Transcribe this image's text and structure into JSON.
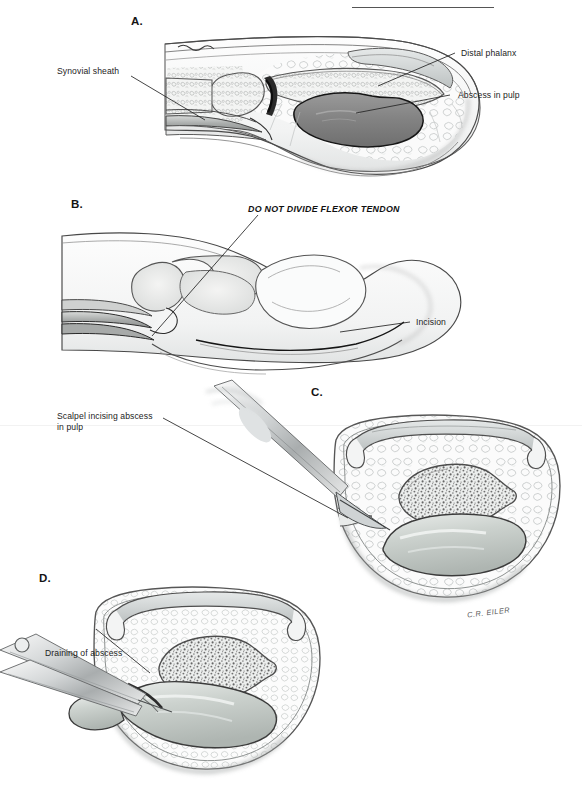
{
  "figure": {
    "title_rule": true,
    "artist_signature": "C.R. EILER",
    "panels": [
      {
        "id": "A",
        "letter": "A.",
        "description": "Sagittal section of distal finger showing felon: abscess in pulp space, distal phalanx, and synovial sheath",
        "labels": [
          {
            "name": "synovial-sheath",
            "text": "Synovial sheath",
            "side": "left"
          },
          {
            "name": "distal-phalanx",
            "text": "Distal phalanx",
            "side": "right"
          },
          {
            "name": "abscess-in-pulp",
            "text": "Abscess in pulp",
            "side": "right"
          }
        ]
      },
      {
        "id": "B",
        "letter": "B.",
        "description": "Lateral view of finger showing planned incision site over the pulp with warning about flexor tendon",
        "warning": "DO NOT DIVIDE FLEXOR TENDON",
        "labels": [
          {
            "name": "incision",
            "text": "Incision",
            "side": "right"
          }
        ]
      },
      {
        "id": "C",
        "letter": "C.",
        "description": "Cross section of fingertip with scalpel incising the abscess in the pulp space below the distal phalanx",
        "labels": [
          {
            "name": "scalpel-incising-abscess",
            "text": "Scalpel incising abscess\nin pulp",
            "side": "left"
          }
        ]
      },
      {
        "id": "D",
        "letter": "D.",
        "description": "Cross section of fingertip with hemostat draining the abscess, pus exuding from the incision",
        "labels": [
          {
            "name": "draining-of-abscess",
            "text": "Draining of abscess",
            "side": "left"
          }
        ]
      }
    ]
  },
  "colors": {
    "ink": "#1c1c1c",
    "leader_line": "#2a2a2a",
    "tissue_outline": "#6d6d6d",
    "abscess_dark": "#8a8a8a",
    "abscess_light": "#c9cdc9",
    "bone_stipple": "#7b7b7b",
    "fat_lobule": "#cfd3d2",
    "nail": "#b9bdbd",
    "instrument": "#bfc3c4",
    "paper": "#ffffff"
  }
}
